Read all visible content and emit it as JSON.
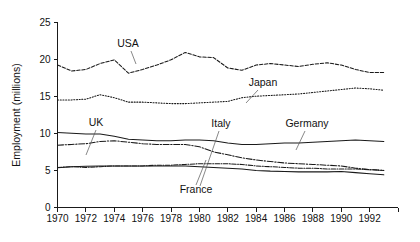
{
  "chart_data": {
    "type": "line",
    "title": "",
    "subtitle": "",
    "xlabel": "",
    "ylabel": "Employment (millions)",
    "xlim": [
      1970,
      1993
    ],
    "ylim": [
      0,
      25
    ],
    "grid": false,
    "legend_position": "inline-annotations",
    "x_tick_labels": [
      "1970",
      "1972",
      "1974",
      "1976",
      "1978",
      "1980",
      "1982",
      "1984",
      "1986",
      "1988",
      "1990",
      "1992"
    ],
    "x_ticks": [
      1970,
      1972,
      1974,
      1976,
      1978,
      1980,
      1982,
      1984,
      1986,
      1988,
      1990,
      1992
    ],
    "y_tick_labels": [
      "0",
      "5",
      "10",
      "15",
      "20",
      "25"
    ],
    "y_ticks": [
      0,
      5,
      10,
      15,
      20,
      25
    ],
    "x": [
      1970,
      1971,
      1972,
      1973,
      1974,
      1975,
      1976,
      1977,
      1978,
      1979,
      1980,
      1981,
      1982,
      1983,
      1984,
      1985,
      1986,
      1987,
      1988,
      1989,
      1990,
      1991,
      1992,
      1993
    ],
    "series": [
      {
        "name": "USA",
        "style": "dashed",
        "values": [
          19.2,
          18.4,
          18.6,
          19.4,
          19.9,
          18.1,
          18.6,
          19.2,
          19.9,
          20.9,
          20.3,
          20.2,
          18.8,
          18.5,
          19.2,
          19.4,
          19.2,
          19.0,
          19.3,
          19.5,
          19.2,
          18.6,
          18.2,
          18.2
        ]
      },
      {
        "name": "Japan",
        "style": "dotted",
        "values": [
          14.5,
          14.5,
          14.6,
          15.2,
          14.8,
          14.2,
          14.2,
          14.1,
          14.0,
          14.0,
          14.1,
          14.2,
          14.3,
          14.8,
          15.0,
          15.1,
          15.2,
          15.3,
          15.5,
          15.7,
          15.9,
          16.1,
          16.0,
          15.8
        ]
      },
      {
        "name": "Germany",
        "style": "solid",
        "values": [
          10.1,
          10.0,
          9.9,
          9.9,
          9.6,
          9.2,
          9.1,
          9.0,
          9.0,
          9.1,
          9.1,
          9.0,
          8.7,
          8.5,
          8.5,
          8.6,
          8.7,
          8.7,
          8.8,
          8.9,
          9.0,
          9.1,
          9.0,
          8.9
        ]
      },
      {
        "name": "UK",
        "style": "dash-dot",
        "values": [
          8.4,
          8.5,
          8.6,
          8.9,
          9.0,
          8.8,
          8.6,
          8.5,
          8.5,
          8.5,
          8.2,
          7.5,
          7.1,
          6.7,
          6.4,
          6.2,
          6.0,
          5.9,
          5.8,
          5.7,
          5.6,
          5.3,
          5.1,
          5.0
        ]
      },
      {
        "name": "Italy",
        "style": "dash-dot-fine",
        "values": [
          5.4,
          5.5,
          5.4,
          5.5,
          5.6,
          5.6,
          5.6,
          5.7,
          5.7,
          5.8,
          5.9,
          5.9,
          5.9,
          5.8,
          5.6,
          5.5,
          5.4,
          5.3,
          5.3,
          5.2,
          5.2,
          5.2,
          5.1,
          5.0
        ]
      },
      {
        "name": "France",
        "style": "solid",
        "values": [
          5.35,
          5.5,
          5.55,
          5.6,
          5.6,
          5.6,
          5.6,
          5.6,
          5.6,
          5.6,
          5.5,
          5.4,
          5.3,
          5.2,
          5.0,
          4.9,
          4.85,
          4.8,
          4.8,
          4.8,
          4.85,
          4.7,
          4.55,
          4.4
        ]
      }
    ],
    "annotations": [
      {
        "text": "USA",
        "x": 128,
        "y": 47,
        "leader": [
          [
            131,
            51
          ],
          [
            136,
            64
          ]
        ]
      },
      {
        "text": "Japan",
        "x": 263,
        "y": 86,
        "leader": [
          [
            258,
            90
          ],
          [
            246,
            103
          ]
        ]
      },
      {
        "text": "UK",
        "x": 96,
        "y": 126,
        "leader": [
          [
            96,
            130
          ],
          [
            86,
            155
          ]
        ]
      },
      {
        "text": "Italy",
        "x": 221,
        "y": 127,
        "leader": [
          [
            219,
            131
          ],
          [
            200,
            186
          ]
        ]
      },
      {
        "text": "Germany",
        "x": 307,
        "y": 127,
        "leader": [
          [
            305,
            131
          ],
          [
            296,
            150
          ]
        ]
      },
      {
        "text": "France",
        "x": 196,
        "y": 193,
        "leader": [
          [
            196,
            185
          ],
          [
            206,
            160
          ]
        ]
      }
    ]
  }
}
